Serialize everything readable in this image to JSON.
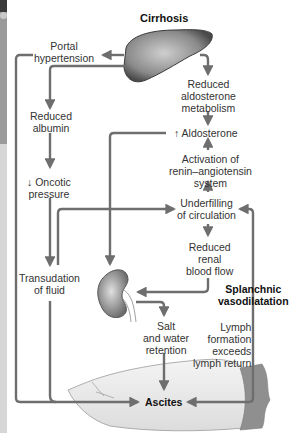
{
  "title": "Cirrhosis",
  "nodes": {
    "portal_hypertension": [
      "Portal",
      "hypertension"
    ],
    "reduced_albumin": [
      "Reduced",
      "albumin"
    ],
    "oncotic_pressure": [
      "↓ Oncotic",
      "pressure"
    ],
    "transudation": [
      "Transudation",
      "of fluid"
    ],
    "reduced_aldosterone_metabolism": [
      "Reduced",
      "aldosterone",
      "metabolism"
    ],
    "aldosterone": "↑ Aldosterone",
    "renin_angiotensin": [
      "Activation of",
      "renin–angiotensin",
      "system"
    ],
    "underfilling": [
      "Underfilling",
      "of circulation"
    ],
    "renal_blood_flow": [
      "Reduced",
      "renal",
      "blood flow"
    ],
    "splanchnic": [
      "Splanchnic",
      "vasodilatation"
    ],
    "salt_water": [
      "Salt",
      "and water",
      "retention"
    ],
    "lymph": [
      "Lymph",
      "formation",
      "exceeds",
      "lymph return"
    ],
    "ascites": "Ascites"
  },
  "icons": [
    "liver-illustration",
    "kidney-illustration",
    "abdomen-illustration"
  ],
  "colors": {
    "arrow": "#6e6e6e",
    "text": "#333333",
    "liver": "#7a7a7a",
    "kidney": "#8a8a8a"
  }
}
